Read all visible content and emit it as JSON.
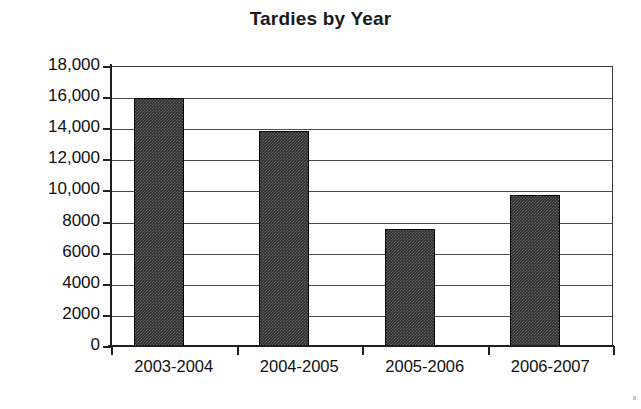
{
  "chart_data": {
    "type": "bar",
    "title": "Tardies by Year",
    "xlabel": "",
    "ylabel": "",
    "categories": [
      "2003-2004",
      "2004-2005",
      "2005-2006",
      "2006-2007"
    ],
    "values": [
      16000,
      13900,
      7600,
      9800
    ],
    "ylim": [
      0,
      18000
    ],
    "ytick_values": [
      18000,
      16000,
      14000,
      12000,
      10000,
      8000,
      6000,
      4000,
      2000,
      0
    ],
    "ytick_labels": [
      "18,000",
      "16,000",
      "14,000",
      "12,000",
      "10,000",
      "8000",
      "6000",
      "4000",
      "2000",
      "0"
    ],
    "grid": true,
    "legend": "none",
    "bar_color": "#2e2e2e",
    "bar_edge_color": "#000000",
    "axis_color": "#1f1f1f",
    "grid_color": "#4a4a4a",
    "background_color": "#ffffff"
  }
}
